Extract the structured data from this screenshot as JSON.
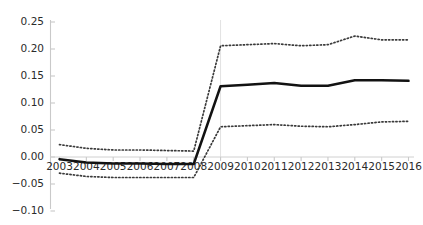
{
  "chart_data": {
    "type": "line",
    "title": "",
    "subtitle": "",
    "xlabel": "",
    "ylabel": "",
    "categories": [
      "2003",
      "2004",
      "2005",
      "2006",
      "2007",
      "2008",
      "2009",
      "2010",
      "2011",
      "2012",
      "2013",
      "2014",
      "2015",
      "2016"
    ],
    "x": [
      2003,
      2004,
      2005,
      2006,
      2007,
      2008,
      2009,
      2010,
      2011,
      2012,
      2013,
      2014,
      2015,
      2016
    ],
    "xlim": [
      2003,
      2016
    ],
    "ylim": [
      -0.1,
      0.25
    ],
    "yticks": [
      -0.1,
      -0.05,
      0.0,
      0.05,
      0.1,
      0.15,
      0.2,
      0.25
    ],
    "ytick_labels": [
      "-0.10",
      "-0.05",
      "0.00",
      "0.05",
      "0.10",
      "0.15",
      "0.20",
      "0.25"
    ],
    "xtick_labels": [
      "2003",
      "2004",
      "2005",
      "2006",
      "2007",
      "2008",
      "2009",
      "2010",
      "2011",
      "2012",
      "2013",
      "2014",
      "2015",
      "2016"
    ],
    "grid": false,
    "vertical_gridline_at": 2009,
    "zero_reference_line": true,
    "legend": false,
    "legend_position": "none",
    "series": [
      {
        "name": "Upper bound",
        "style": "dotted",
        "color": "#3a3a3a",
        "values": [
          0.023,
          0.016,
          0.013,
          0.013,
          0.012,
          0.011,
          0.206,
          0.208,
          0.21,
          0.206,
          0.208,
          0.224,
          0.217,
          0.217
        ]
      },
      {
        "name": "Point estimate",
        "style": "solid",
        "color": "#121212",
        "values": [
          -0.004,
          -0.01,
          -0.012,
          -0.012,
          -0.013,
          -0.013,
          0.131,
          0.134,
          0.137,
          0.132,
          0.132,
          0.142,
          0.142,
          0.141
        ]
      },
      {
        "name": "Lower bound",
        "style": "dotted",
        "color": "#3a3a3a",
        "values": [
          -0.03,
          -0.036,
          -0.038,
          -0.038,
          -0.038,
          -0.038,
          0.056,
          0.058,
          0.06,
          0.057,
          0.056,
          0.06,
          0.065,
          0.066
        ]
      }
    ]
  }
}
